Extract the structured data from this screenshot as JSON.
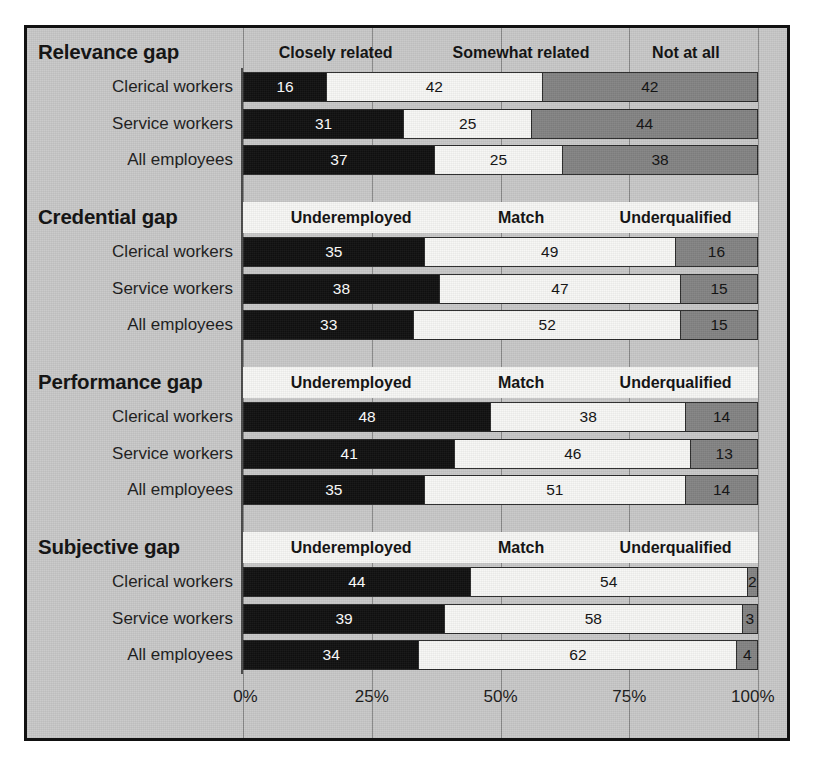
{
  "chart_data": {
    "type": "bar",
    "subtype": "stacked-horizontal-100",
    "title": "",
    "xlabel": "",
    "ylabel": "",
    "xlim": [
      0,
      100
    ],
    "xticks": [
      "0%",
      "25%",
      "50%",
      "75%",
      "100%"
    ],
    "xtick_values": [
      0,
      25,
      50,
      75,
      100
    ],
    "grid": true,
    "legend_position": "per-section-header",
    "categories": [
      "Clerical workers",
      "Service workers",
      "All employees"
    ],
    "sections": [
      {
        "title": "Relevance gap",
        "legend": [
          "Closely related",
          "Somewhat related",
          "Not at all"
        ],
        "legend_band_style": "plain",
        "series": [
          {
            "name": "Clerical workers",
            "values": [
              16,
              42,
              42
            ]
          },
          {
            "name": "Service workers",
            "values": [
              31,
              25,
              44
            ]
          },
          {
            "name": "All employees",
            "values": [
              37,
              25,
              38
            ]
          }
        ]
      },
      {
        "title": "Credential gap",
        "legend": [
          "Underemployed",
          "Match",
          "Underqualified"
        ],
        "legend_band_style": "white",
        "series": [
          {
            "name": "Clerical workers",
            "values": [
              35,
              49,
              16
            ]
          },
          {
            "name": "Service workers",
            "values": [
              38,
              47,
              15
            ]
          },
          {
            "name": "All employees",
            "values": [
              33,
              52,
              15
            ]
          }
        ]
      },
      {
        "title": "Performance gap",
        "legend": [
          "Underemployed",
          "Match",
          "Underqualified"
        ],
        "legend_band_style": "white",
        "series": [
          {
            "name": "Clerical workers",
            "values": [
              48,
              38,
              14
            ]
          },
          {
            "name": "Service workers",
            "values": [
              41,
              46,
              13
            ]
          },
          {
            "name": "All employees",
            "values": [
              35,
              51,
              14
            ]
          }
        ]
      },
      {
        "title": "Subjective gap",
        "legend": [
          "Underemployed",
          "Match",
          "Underqualified"
        ],
        "legend_band_style": "white",
        "series": [
          {
            "name": "Clerical workers",
            "values": [
              44,
              54,
              2
            ]
          },
          {
            "name": "Service workers",
            "values": [
              39,
              58,
              3
            ]
          },
          {
            "name": "All employees",
            "values": [
              34,
              62,
              4
            ]
          }
        ]
      }
    ],
    "colors": {
      "segment_1": "#111111",
      "segment_2": "#f7f7f5",
      "segment_3": "#848484",
      "plate_background": "#c9c9c9",
      "frame_border": "#111111"
    }
  }
}
